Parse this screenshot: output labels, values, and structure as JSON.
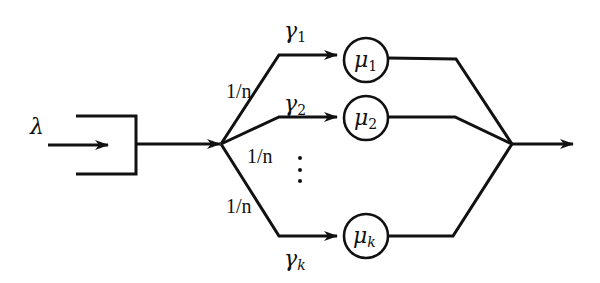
{
  "diagram": {
    "type": "queueing-network",
    "arrival": {
      "symbol": "λ",
      "label": "λ"
    },
    "queue": {
      "name": "input-queue"
    },
    "split_probabilities": [
      "1/n",
      "1/n",
      "1/n"
    ],
    "routes": [
      {
        "rate_symbol": "γ",
        "rate_subscript": "1",
        "server_symbol": "μ",
        "server_subscript": "1"
      },
      {
        "rate_symbol": "γ",
        "rate_subscript": "2",
        "server_symbol": "μ",
        "server_subscript": "2"
      },
      {
        "rate_symbol": "γ",
        "rate_subscript": "k",
        "server_symbol": "μ",
        "server_subscript": "k"
      }
    ],
    "ellipsis": "⋮",
    "colors": {
      "stroke": "#111111",
      "background": "#ffffff"
    }
  }
}
